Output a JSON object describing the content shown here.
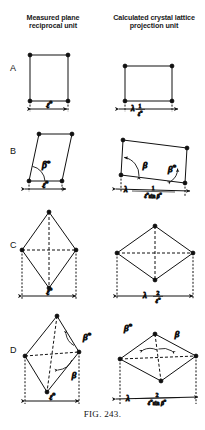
{
  "figure": {
    "caption_prefix": "F",
    "caption_rest": "IG",
    "caption_number": ". 243.",
    "caption_full": "FIG. 243."
  },
  "headers": {
    "left": "Measured plane reciprocal unit",
    "right": "Calculated crystal lattice projection unit"
  },
  "symbols": {
    "lambda": "λ",
    "beta": "β",
    "beta_star": "β*",
    "ell_star": "ℓ*",
    "sin": "sin",
    "one": "1",
    "two": "2"
  },
  "rows": [
    {
      "letter": "A",
      "left": {
        "shape": "rectangle",
        "dimension_label": "ℓ*",
        "angles": []
      },
      "right": {
        "shape": "rectangle",
        "dimension_label": "λ 1/ℓ*",
        "numerator": "1",
        "denominator": "ℓ*",
        "angles": []
      }
    },
    {
      "letter": "B",
      "left": {
        "shape": "parallelogram",
        "dimension_label": "ℓ*",
        "angles": [
          "β*"
        ]
      },
      "right": {
        "shape": "parallelogram",
        "dimension_label": "λ 1/(ℓ* sin β*)",
        "numerator": "1",
        "denominator": "ℓ* sin β*",
        "angles": [
          "β",
          "β*"
        ]
      }
    },
    {
      "letter": "C",
      "left": {
        "shape": "tall-rhombus",
        "dimension_label": "ℓ*",
        "angles": []
      },
      "right": {
        "shape": "wide-rhombus",
        "dimension_label": "λ 2/ℓ*",
        "numerator": "2",
        "denominator": "ℓ*",
        "angles": []
      }
    },
    {
      "letter": "D",
      "left": {
        "shape": "sheared-tall-rhombus",
        "dimension_label": "ℓ*",
        "angles": [
          "β*",
          "β"
        ]
      },
      "right": {
        "shape": "sheared-wide-rhombus",
        "dimension_label": "λ 2/(ℓ* sin β*)",
        "numerator": "2",
        "denominator": "ℓ* sin β*",
        "angles": [
          "β*",
          "β"
        ]
      }
    }
  ],
  "colors": {
    "ink": "#111111",
    "background": "#ffffff"
  }
}
